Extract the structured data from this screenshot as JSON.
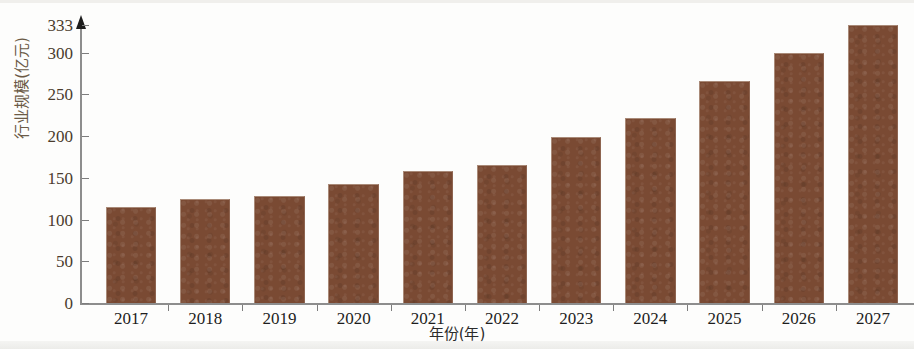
{
  "chart_data": {
    "type": "bar",
    "title": "",
    "subtitle": "",
    "xlabel": "年份(年)",
    "ylabel": "行业规模(亿元)",
    "categories": [
      "2017",
      "2018",
      "2019",
      "2020",
      "2021",
      "2022",
      "2023",
      "2024",
      "2025",
      "2026",
      "2027"
    ],
    "values": [
      115,
      124,
      128,
      142,
      158,
      165,
      199,
      222,
      266,
      299,
      333
    ],
    "series": [
      {
        "name": "行业规模",
        "values": [
          115,
          124,
          128,
          142,
          158,
          165,
          199,
          222,
          266,
          299,
          333
        ]
      }
    ],
    "ylim": [
      0,
      333
    ],
    "xlim_categories": 11,
    "y_ticks": [
      0,
      50,
      100,
      150,
      200,
      250,
      300,
      333
    ],
    "y_tick_labels": [
      "0",
      "50",
      "100",
      "150",
      "200",
      "250",
      "300",
      "333"
    ],
    "grid": false,
    "legend": false,
    "legend_position": "none",
    "bar_color": "#7a4a33",
    "axis_color": "#8d8d8d",
    "tick_label_color": "#4a3b2c",
    "x_label_color": "#1d1d1d",
    "y_axis_title_color": "#6b5a46",
    "background_color": "#fdfdfc"
  },
  "axes": {
    "y_title": "行业规模(亿元)",
    "x_title": "年份(年)"
  }
}
